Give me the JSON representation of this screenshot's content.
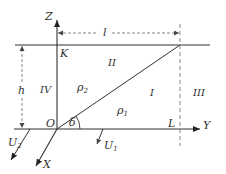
{
  "diagram": {
    "axes": {
      "z_label": "Z",
      "y_label": "Y",
      "x_label": "X",
      "origin_label": "O"
    },
    "points": {
      "k_label": "K",
      "l_point_label": "L"
    },
    "dimensions": {
      "width_label": "l",
      "height_label": "h"
    },
    "angle_label": "δ",
    "regions": {
      "region_1": "I",
      "region_2": "II",
      "region_3": "III",
      "region_4": "IV"
    },
    "media": {
      "rho_1": "ρ",
      "rho_1_sub": "1",
      "rho_2": "ρ",
      "rho_2_sub": "2"
    },
    "velocities": {
      "u1": "U",
      "u1_sub": "1",
      "u2": "U",
      "u2_sub": "2"
    },
    "colors": {
      "line": "#333333",
      "dashed": "#777777"
    }
  }
}
